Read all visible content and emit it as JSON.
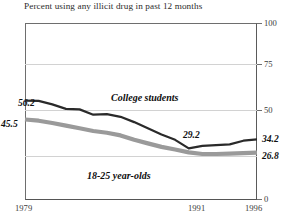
{
  "caption": {
    "text": "Percent using any illicit drug in past 12 months",
    "clipped_top_text": "Figure: Trends in illicit drug use"
  },
  "axes": {
    "right_ticks": [
      "100",
      "75",
      "50",
      "0"
    ],
    "x_ticks": [
      "1979",
      "1991",
      "1996"
    ]
  },
  "annotations": {
    "college_start": "56.2",
    "young_start": "45.5",
    "college_mid": "29.2",
    "college_end": "34.2",
    "young_end": "26.8",
    "college_series_label": "College students",
    "young_series_label": "18-25 year-olds"
  },
  "colors": {
    "college_line": "#2a2a2a",
    "young_line": "#9a9a9a",
    "grid": "#d2d2d2",
    "frame": "#5a5a5a",
    "background": "#ffffff"
  },
  "chart_data": {
    "type": "line",
    "title": "Percent using any illicit drug in past 12 months",
    "xlabel": "",
    "ylabel": "",
    "ylim": [
      0,
      100
    ],
    "yticks": [
      0,
      25,
      50,
      75,
      100
    ],
    "ytick_labels_shown": [
      0,
      50,
      75,
      100
    ],
    "grid": true,
    "grid_axis": "y",
    "legend_position": "inline-annotation",
    "x": [
      1979,
      1980,
      1981,
      1982,
      1983,
      1984,
      1985,
      1986,
      1987,
      1988,
      1989,
      1990,
      1991,
      1992,
      1993,
      1994,
      1995,
      1996
    ],
    "series": [
      {
        "name": "College students",
        "color": "#2a2a2a",
        "values": [
          56.2,
          56.0,
          54.0,
          51.5,
          51.2,
          48.2,
          48.5,
          47.0,
          44.0,
          40.5,
          37.0,
          34.0,
          29.2,
          30.6,
          31.0,
          31.4,
          33.5,
          34.2
        ],
        "start_label": "56.2",
        "mid_label": {
          "x": 1991,
          "value": "29.2"
        },
        "end_label": "34.2"
      },
      {
        "name": "18-25 year-olds",
        "color": "#9a9a9a",
        "values": [
          45.5,
          44.8,
          43.5,
          42.0,
          40.5,
          39.0,
          38.0,
          36.5,
          34.0,
          32.0,
          30.0,
          28.5,
          26.9,
          26.0,
          26.0,
          26.2,
          26.5,
          26.8
        ],
        "start_label": "45.5",
        "end_label": "26.8"
      }
    ]
  }
}
